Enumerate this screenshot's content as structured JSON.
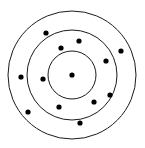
{
  "figure": {
    "canvas": {
      "width": 145,
      "height": 148,
      "background": "#ffffff"
    },
    "stroke_color": "#1a1a1a",
    "dot_color": "#000000",
    "stroke_width": 1
  },
  "chart_data": {
    "type": "scatter",
    "subtitle": "",
    "xlabel": "",
    "ylabel": "",
    "xlim": [
      0,
      145
    ],
    "ylim": [
      0,
      148
    ],
    "grid": false,
    "legend": "none",
    "center": {
      "x": 72,
      "y": 75
    },
    "rings": [
      {
        "name": "inner-circle",
        "radius": 24,
        "stroke": "#1a1a1a",
        "fill": "none"
      },
      {
        "name": "middle-circle",
        "radius": 45,
        "stroke": "#1a1a1a",
        "fill": "none"
      },
      {
        "name": "outer-circle",
        "radius": 64,
        "stroke": "#1a1a1a",
        "fill": "none"
      }
    ],
    "point_radius": 2.6,
    "point_color": "#000000",
    "points": [
      {
        "x": 72,
        "y": 75,
        "zone": "center"
      },
      {
        "x": 46,
        "y": 33,
        "zone": "outer-band"
      },
      {
        "x": 61,
        "y": 48,
        "zone": "middle-band"
      },
      {
        "x": 79,
        "y": 41,
        "zone": "middle-band"
      },
      {
        "x": 121,
        "y": 51,
        "zone": "outer-band"
      },
      {
        "x": 106,
        "y": 61,
        "zone": "middle-band"
      },
      {
        "x": 21,
        "y": 77,
        "zone": "outer-band"
      },
      {
        "x": 43,
        "y": 79,
        "zone": "middle-band"
      },
      {
        "x": 28,
        "y": 112,
        "zone": "outer-band"
      },
      {
        "x": 59,
        "y": 107,
        "zone": "middle-band"
      },
      {
        "x": 94,
        "y": 102,
        "zone": "middle-band"
      },
      {
        "x": 80,
        "y": 123,
        "zone": "outer-band"
      },
      {
        "x": 110,
        "y": 95,
        "zone": "middle-band"
      }
    ]
  }
}
